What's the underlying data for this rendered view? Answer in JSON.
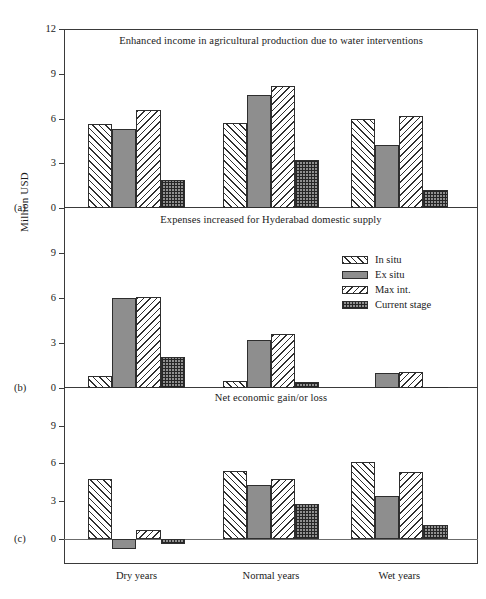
{
  "figure": {
    "ylabel": "Million USD",
    "categories": [
      "Dry years",
      "Normal years",
      "Wet years"
    ],
    "panel_letters": [
      "(a)",
      "(b)",
      "(c)"
    ],
    "series_names": [
      "In situ",
      "Ex situ",
      "Max int.",
      "Current stage"
    ]
  },
  "legend": {
    "items": [
      {
        "label": "In situ",
        "pattern": "forward-diagonal-hatch"
      },
      {
        "label": "Ex situ",
        "pattern": "solid-gray"
      },
      {
        "label": "Max int.",
        "pattern": "backward-diagonal-hatch"
      },
      {
        "label": "Current stage",
        "pattern": "dense-crosshatch"
      }
    ]
  },
  "chart_data": [
    {
      "type": "bar",
      "panel": "(a)",
      "title": "Enhanced income in agricultural production due to water interventions",
      "categories": [
        "Dry years",
        "Normal years",
        "Wet years"
      ],
      "series": [
        {
          "name": "In situ",
          "values": [
            5.6,
            5.7,
            6.0
          ]
        },
        {
          "name": "Ex situ",
          "values": [
            5.3,
            7.6,
            4.2
          ]
        },
        {
          "name": "Max int.",
          "values": [
            6.6,
            8.2,
            6.2
          ]
        },
        {
          "name": "Current stage",
          "values": [
            1.9,
            3.2,
            1.2
          ]
        }
      ],
      "xlabel": "",
      "ylabel": "Million USD",
      "ylim": [
        0,
        12
      ],
      "yticks": [
        0,
        3,
        6,
        9,
        12
      ],
      "grid": false,
      "legend_position": "panel-b-upper-right"
    },
    {
      "type": "bar",
      "panel": "(b)",
      "title": "Expenses increased for Hyderabad domestic supply",
      "categories": [
        "Dry years",
        "Normal years",
        "Wet years"
      ],
      "series": [
        {
          "name": "In situ",
          "values": [
            0.8,
            0.45,
            0.0
          ]
        },
        {
          "name": "Ex situ",
          "values": [
            6.0,
            3.2,
            1.0
          ]
        },
        {
          "name": "Max int.",
          "values": [
            6.05,
            3.6,
            1.1
          ]
        },
        {
          "name": "Current stage",
          "values": [
            2.1,
            0.4,
            0.1
          ]
        }
      ],
      "xlabel": "",
      "ylabel": "Million USD",
      "ylim": [
        0,
        12
      ],
      "yticks": [
        0,
        3,
        6,
        9
      ],
      "grid": false
    },
    {
      "type": "bar",
      "panel": "(c)",
      "title": "Net economic gain/or loss",
      "categories": [
        "Dry years",
        "Normal years",
        "Wet years"
      ],
      "series": [
        {
          "name": "In situ",
          "values": [
            4.8,
            5.4,
            6.1
          ]
        },
        {
          "name": "Ex situ",
          "values": [
            -0.8,
            4.3,
            3.4
          ]
        },
        {
          "name": "Max int.",
          "values": [
            0.7,
            4.8,
            5.3
          ]
        },
        {
          "name": "Current stage",
          "values": [
            -0.4,
            2.8,
            1.1
          ]
        }
      ],
      "xlabel": "",
      "ylabel": "Million USD",
      "ylim": [
        -2,
        12
      ],
      "yticks": [
        0,
        3,
        6,
        9
      ],
      "grid": false
    }
  ]
}
